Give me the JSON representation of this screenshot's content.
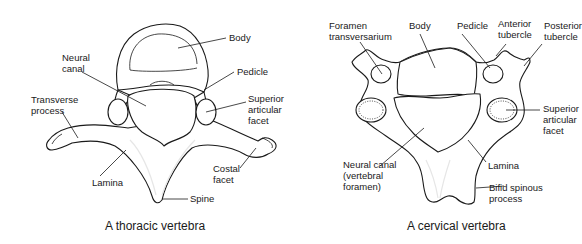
{
  "diagrams": [
    {
      "id": "thoracic",
      "caption": "A thoracic vertebra",
      "labels": {
        "body": "Body",
        "neural_canal": "Neural\ncanal",
        "pedicle": "Pedicle",
        "transverse_process": "Transverse\nprocess",
        "superior_articular_facet": "Superior\narticular\nfacet",
        "costal_facet": "Costal\nfacet",
        "lamina": "Lamina",
        "spine": "Spine"
      }
    },
    {
      "id": "cervical",
      "caption": "A cervical vertebra",
      "labels": {
        "foramen_transversarium": "Foramen\ntransversarium",
        "body": "Body",
        "pedicle": "Pedicle",
        "anterior_tubercle": "Anterior\ntubercle",
        "posterior_tubercle": "Posterior\ntubercle",
        "superior_articular_facet": "Superior\narticular\nfacet",
        "neural_canal": "Neural canal\n(vertebral\nforamen)",
        "lamina": "Lamina",
        "bifid_spinous_process": "Bifid spinous\nprocess"
      }
    }
  ],
  "colors": {
    "line": "#1a1a1a",
    "background": "#ffffff"
  }
}
